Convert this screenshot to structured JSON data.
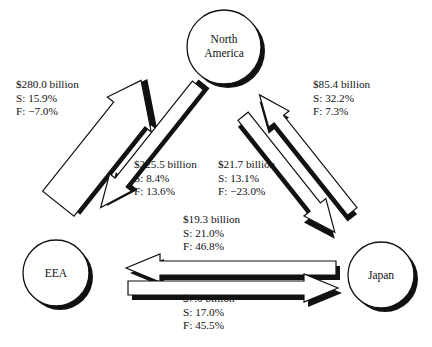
{
  "diagram": {
    "type": "trade-flow-triangle",
    "background": "#ffffff",
    "ink": "#111111",
    "shadow": "#111111",
    "fill": "#ffffff"
  },
  "nodes": [
    {
      "id": "north-america",
      "label_line1": "North",
      "label_line2": "America",
      "cx": 224,
      "cy": 47,
      "r": 37
    },
    {
      "id": "eea",
      "label_line1": "EEA",
      "label_line2": "",
      "cx": 56,
      "cy": 273,
      "r": 33
    },
    {
      "id": "japan",
      "label_line1": "Japan",
      "label_line2": "",
      "cx": 381,
      "cy": 275,
      "r": 33
    }
  ],
  "flows": [
    {
      "id": "eea-to-north-america",
      "from": "EEA",
      "to": "North America",
      "amount": "$280.0 billion",
      "s_label": "S: 15.9%",
      "f_label": "F: −7.0%",
      "s_value": 15.9,
      "f_value": -7.0,
      "amount_value": 280.0,
      "direction": "up-right",
      "weight": "thick"
    },
    {
      "id": "north-america-to-eea",
      "from": "North America",
      "to": "EEA",
      "amount": "$225.5 billion",
      "s_label": "S: 8.4%",
      "f_label": "F: 13.6%",
      "s_value": 8.4,
      "f_value": 13.6,
      "amount_value": 225.5,
      "direction": "down-left",
      "weight": "medium"
    },
    {
      "id": "north-america-to-japan",
      "from": "North America",
      "to": "Japan",
      "amount": "$21.7 billion",
      "s_label": "S: 13.1%",
      "f_label": "F: −23.0%",
      "s_value": 13.1,
      "f_value": -23.0,
      "amount_value": 21.7,
      "direction": "down-right",
      "weight": "thin"
    },
    {
      "id": "japan-to-north-america",
      "from": "Japan",
      "to": "North America",
      "amount": "$85.4 billion",
      "s_label": "S: 32.2%",
      "f_label": "F: 7.3%",
      "s_value": 32.2,
      "f_value": 7.3,
      "amount_value": 85.4,
      "direction": "up-left",
      "weight": "thin"
    },
    {
      "id": "japan-to-eea",
      "from": "Japan",
      "to": "EEA",
      "amount": "$19.3 billion",
      "s_label": "S: 21.0%",
      "f_label": "F: 46.8%",
      "s_value": 21.0,
      "f_value": 46.8,
      "amount_value": 19.3,
      "direction": "left",
      "weight": "medium"
    },
    {
      "id": "eea-to-japan",
      "from": "EEA",
      "to": "Japan",
      "amount": "$7.0 billion",
      "s_label": "S: 17.0%",
      "f_label": "F: 45.5%",
      "s_value": 17.0,
      "f_value": 45.5,
      "amount_value": 7.0,
      "direction": "right",
      "weight": "medium"
    }
  ]
}
